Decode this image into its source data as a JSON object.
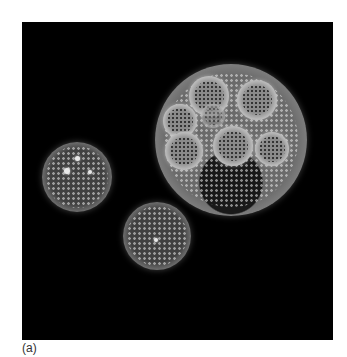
{
  "figure": {
    "caption_label": "(a)",
    "background_color": "#000000",
    "colonies": [
      {
        "name": "large-colony",
        "daughter_colonies": 7
      },
      {
        "name": "left-colony",
        "daughter_colonies": 0
      },
      {
        "name": "small-colony",
        "daughter_colonies": 0
      }
    ]
  }
}
